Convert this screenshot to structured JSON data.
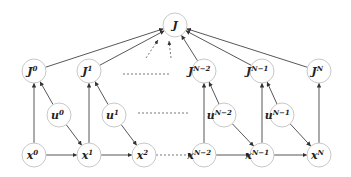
{
  "diagram": {
    "type": "graphical-model",
    "nodes": {
      "J": {
        "base": "J",
        "sup": "",
        "x": 175,
        "y": 25
      },
      "J0": {
        "base": "J",
        "sup": "0",
        "x": 34,
        "y": 71
      },
      "J1": {
        "base": "J",
        "sup": "1",
        "x": 89,
        "y": 71
      },
      "JN2": {
        "base": "J",
        "sup": "N−2",
        "x": 204,
        "y": 71
      },
      "JN1": {
        "base": "J",
        "sup": "N−1",
        "x": 262,
        "y": 71
      },
      "JN": {
        "base": "J",
        "sup": "N",
        "x": 319,
        "y": 71
      },
      "u0": {
        "base": "u",
        "sup": "0",
        "x": 59,
        "y": 115
      },
      "u1": {
        "base": "u",
        "sup": "1",
        "x": 114,
        "y": 115
      },
      "uN2": {
        "base": "u",
        "sup": "N−2",
        "x": 224,
        "y": 115
      },
      "uN1": {
        "base": "u",
        "sup": "N−1",
        "x": 282,
        "y": 115
      },
      "x0": {
        "base": "x",
        "sup": "0",
        "x": 34,
        "y": 155
      },
      "x1": {
        "base": "x",
        "sup": "1",
        "x": 89,
        "y": 155
      },
      "x2": {
        "base": "x",
        "sup": "2",
        "x": 144,
        "y": 155
      },
      "xN2": {
        "base": "x",
        "sup": "N−2",
        "x": 204,
        "y": 155
      },
      "xN1": {
        "base": "x",
        "sup": "N−1",
        "x": 262,
        "y": 155
      },
      "xN": {
        "base": "x",
        "sup": "N",
        "x": 319,
        "y": 155
      }
    },
    "edges": [
      [
        "J0",
        "J"
      ],
      [
        "J1",
        "J"
      ],
      [
        "JN2",
        "J"
      ],
      [
        "JN1",
        "J"
      ],
      [
        "JN",
        "J"
      ],
      [
        "x0",
        "J0"
      ],
      [
        "u0",
        "J0"
      ],
      [
        "x1",
        "J1"
      ],
      [
        "u1",
        "J1"
      ],
      [
        "xN2",
        "JN2"
      ],
      [
        "uN2",
        "JN2"
      ],
      [
        "xN1",
        "JN1"
      ],
      [
        "uN1",
        "JN1"
      ],
      [
        "xN",
        "JN"
      ],
      [
        "x0",
        "x1"
      ],
      [
        "u0",
        "x1"
      ],
      [
        "x1",
        "x2"
      ],
      [
        "u1",
        "x2"
      ],
      [
        "xN2",
        "xN1"
      ],
      [
        "uN2",
        "xN1"
      ],
      [
        "xN1",
        "xN"
      ],
      [
        "uN1",
        "xN"
      ]
    ],
    "dashed_edges": [
      [
        "x2",
        "xN2"
      ]
    ],
    "ellipsis_lines": [
      {
        "x1": 123,
        "y1": 74,
        "x2": 170,
        "y2": 74
      },
      {
        "x1": 138,
        "y1": 113,
        "x2": 190,
        "y2": 113
      }
    ],
    "dashed_arrows_to_J": [
      {
        "x1": 146,
        "y1": 58,
        "x2": 158,
        "y2": 40
      },
      {
        "x1": 171,
        "y1": 58,
        "x2": 169,
        "y2": 41
      }
    ],
    "colors": {
      "node_stroke": "#c8c8c8",
      "edge": "#444444"
    }
  }
}
